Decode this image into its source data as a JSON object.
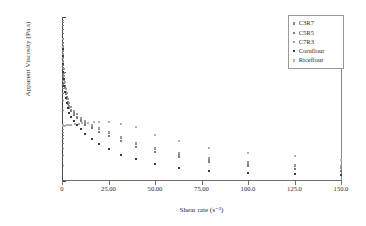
{
  "chart_data": {
    "type": "scatter",
    "title": "",
    "xlabel": "Shear rate (s⁻¹)",
    "ylabel": "Apparent Viscosity (Pa.s)",
    "xlim": [
      0,
      150
    ],
    "ylim": [
      0.1,
      100
    ],
    "yscale": "log",
    "xscale": "linear",
    "grid": false,
    "legend_position": "top-right",
    "xticks": [
      "0",
      "25.00",
      "50.00",
      "75.00",
      "100.0",
      "125.0",
      "150.0"
    ],
    "xtick_values": [
      0,
      25,
      50,
      75,
      100,
      125,
      150
    ],
    "yticks": [
      "100.0",
      "10.00",
      "1.000",
      "0.1000"
    ],
    "ytick_values": [
      100,
      10,
      1,
      0.1
    ],
    "series": [
      {
        "name": "C3R7",
        "color": "#8a8a8a",
        "points": [
          [
            0.3,
            33.0
          ],
          [
            0.4,
            24.0
          ],
          [
            0.5,
            18.0
          ],
          [
            0.7,
            13.0
          ],
          [
            0.9,
            9.5
          ],
          [
            1.2,
            7.0
          ],
          [
            1.5,
            5.4
          ],
          [
            2.0,
            4.2
          ],
          [
            2.5,
            3.4
          ],
          [
            3.2,
            2.8
          ],
          [
            4.0,
            2.35
          ],
          [
            5.0,
            2.0
          ],
          [
            6.3,
            1.72
          ],
          [
            8.0,
            1.5
          ],
          [
            10.0,
            1.32
          ],
          [
            12.5,
            1.17
          ],
          [
            16.0,
            1.0
          ],
          [
            20.0,
            0.88
          ],
          [
            25.0,
            0.74
          ],
          [
            31.5,
            0.6
          ],
          [
            40.0,
            0.47
          ],
          [
            50.0,
            0.38
          ],
          [
            63.0,
            0.3
          ],
          [
            79.0,
            0.245
          ],
          [
            100.0,
            0.205
          ],
          [
            125.0,
            0.185
          ],
          [
            150.0,
            0.175
          ]
        ]
      },
      {
        "name": "C5R5",
        "color": "#7d7d7d",
        "points": [
          [
            0.3,
            29.0
          ],
          [
            0.4,
            21.0
          ],
          [
            0.5,
            16.0
          ],
          [
            0.7,
            11.5
          ],
          [
            0.9,
            8.5
          ],
          [
            1.2,
            6.3
          ],
          [
            1.5,
            5.0
          ],
          [
            2.0,
            3.9
          ],
          [
            2.5,
            3.2
          ],
          [
            3.2,
            2.6
          ],
          [
            4.0,
            2.2
          ],
          [
            5.0,
            1.88
          ],
          [
            6.3,
            1.62
          ],
          [
            8.0,
            1.42
          ],
          [
            10.0,
            1.24
          ],
          [
            12.5,
            1.08
          ],
          [
            16.0,
            0.92
          ],
          [
            20.0,
            0.8
          ],
          [
            25.0,
            0.67
          ],
          [
            31.5,
            0.54
          ],
          [
            40.0,
            0.42
          ],
          [
            50.0,
            0.335
          ],
          [
            63.0,
            0.27
          ],
          [
            79.0,
            0.225
          ],
          [
            100.0,
            0.19
          ],
          [
            125.0,
            0.165
          ],
          [
            150.0,
            0.155
          ]
        ]
      },
      {
        "name": "C7R3",
        "color": "#9c9c9c",
        "points": [
          [
            0.3,
            40.0
          ],
          [
            0.4,
            28.0
          ],
          [
            0.5,
            21.0
          ],
          [
            0.7,
            15.0
          ],
          [
            0.9,
            11.0
          ],
          [
            1.2,
            8.2
          ],
          [
            1.5,
            6.4
          ],
          [
            2.0,
            4.9
          ],
          [
            2.5,
            4.0
          ],
          [
            3.2,
            3.2
          ],
          [
            4.0,
            2.65
          ],
          [
            5.0,
            2.25
          ],
          [
            6.3,
            1.92
          ],
          [
            8.0,
            1.66
          ],
          [
            10.0,
            1.45
          ],
          [
            12.5,
            1.27
          ],
          [
            16.0,
            1.08
          ],
          [
            20.0,
            0.95
          ],
          [
            25.0,
            0.8
          ],
          [
            31.5,
            0.65
          ],
          [
            40.0,
            0.5
          ],
          [
            50.0,
            0.4
          ],
          [
            63.0,
            0.32
          ],
          [
            79.0,
            0.26
          ],
          [
            100.0,
            0.22
          ],
          [
            125.0,
            0.2
          ],
          [
            150.0,
            0.19
          ]
        ]
      },
      {
        "name": "Cornflour",
        "color": "#3d3d3d",
        "points": [
          [
            0.3,
            26.0
          ],
          [
            0.4,
            19.0
          ],
          [
            0.5,
            14.0
          ],
          [
            0.7,
            10.0
          ],
          [
            0.9,
            7.4
          ],
          [
            1.2,
            5.5
          ],
          [
            1.5,
            4.3
          ],
          [
            2.0,
            3.3
          ],
          [
            2.5,
            2.7
          ],
          [
            3.2,
            2.15
          ],
          [
            4.0,
            1.78
          ],
          [
            5.0,
            1.48
          ],
          [
            6.3,
            1.24
          ],
          [
            8.0,
            1.05
          ],
          [
            10.0,
            0.88
          ],
          [
            12.5,
            0.72
          ],
          [
            16.0,
            0.58
          ],
          [
            20.0,
            0.47
          ],
          [
            25.0,
            0.38
          ],
          [
            31.5,
            0.305
          ],
          [
            40.0,
            0.25
          ],
          [
            50.0,
            0.205
          ],
          [
            63.0,
            0.175
          ],
          [
            79.0,
            0.155
          ],
          [
            100.0,
            0.14
          ],
          [
            125.0,
            0.135
          ],
          [
            150.0,
            0.13
          ]
        ]
      },
      {
        "name": "Riceflour",
        "color": "#b0b0b0",
        "points": [
          [
            0.3,
            1.05
          ],
          [
            0.5,
            1.02
          ],
          [
            0.8,
            1.0
          ],
          [
            1.2,
            1.0
          ],
          [
            1.8,
            1.02
          ],
          [
            2.5,
            1.05
          ],
          [
            3.5,
            1.07
          ],
          [
            5.0,
            1.08
          ],
          [
            7.0,
            1.1
          ],
          [
            9.0,
            1.12
          ],
          [
            11.0,
            1.14
          ],
          [
            14.0,
            1.16
          ],
          [
            17.0,
            1.18
          ],
          [
            20.0,
            1.19
          ],
          [
            25.0,
            1.18
          ],
          [
            31.5,
            1.12
          ],
          [
            40.0,
            0.97
          ],
          [
            50.0,
            0.7
          ],
          [
            63.0,
            0.53
          ],
          [
            79.0,
            0.41
          ],
          [
            100.0,
            0.33
          ],
          [
            125.0,
            0.285
          ],
          [
            150.0,
            0.245
          ]
        ]
      }
    ]
  },
  "legend": {
    "entries": [
      {
        "label": "C3R7"
      },
      {
        "label": "C5R5"
      },
      {
        "label": "C7R3"
      },
      {
        "label": "Cornflour"
      },
      {
        "label": "Riceflour"
      }
    ]
  }
}
